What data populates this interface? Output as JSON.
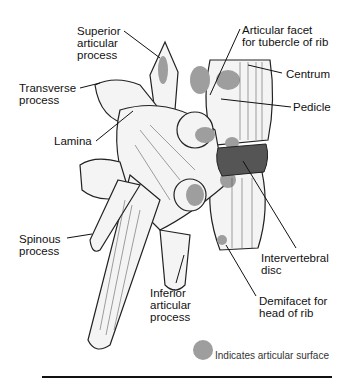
{
  "figure": {
    "labels": [
      {
        "id": "superior-articular-process",
        "text": "Superior\narticular\nprocess"
      },
      {
        "id": "transverse-process",
        "text": "Transverse\nprocess"
      },
      {
        "id": "lamina",
        "text": "Lamina"
      },
      {
        "id": "spinous-process",
        "text": "Spinous\nprocess"
      },
      {
        "id": "inferior-articular-process",
        "text": "Inferior\narticular\nprocess"
      },
      {
        "id": "articular-facet-tubercle",
        "text": "Articular facet\nfor tubercle of rib"
      },
      {
        "id": "centrum",
        "text": "Centrum"
      },
      {
        "id": "pedicle",
        "text": "Pedicle"
      },
      {
        "id": "intervertebral-disc",
        "text": "Intervertebral\ndisc"
      },
      {
        "id": "demifacet-head",
        "text": "Demifacet for\nhead of rib"
      }
    ],
    "legend": {
      "symbol": "gray-circle",
      "text": "Indicates articular surface",
      "color": "#9e9e9e"
    }
  }
}
